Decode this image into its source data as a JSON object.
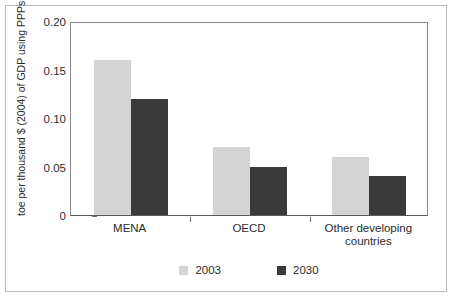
{
  "figure": {
    "clipped_top_text": "",
    "border_color": "#b9b9b9"
  },
  "chart_data": {
    "type": "bar",
    "title": "",
    "xlabel": "",
    "ylabel": "toe per thousand $ (2004) of GDP using PPPs",
    "categories": [
      "MENA",
      "OECD",
      "Other developing countries"
    ],
    "series": [
      {
        "name": "2003",
        "color": "#d4d4d4",
        "values": [
          0.16,
          0.07,
          0.06
        ]
      },
      {
        "name": "2030",
        "color": "#3a3a3a",
        "values": [
          0.12,
          0.05,
          0.04
        ]
      }
    ],
    "ylim": [
      0,
      0.2
    ],
    "yticks": [
      0,
      0.05,
      0.1,
      0.15,
      0.2
    ],
    "ytick_labels": [
      "0",
      "0.05",
      "0.10",
      "0.15",
      "0.20"
    ],
    "grid": false,
    "legend_position": "bottom"
  },
  "axis": {
    "ticks": [
      {
        "label": "0.20",
        "value": 0.2
      },
      {
        "label": "0.15",
        "value": 0.15
      },
      {
        "label": "0.10",
        "value": 0.1
      },
      {
        "label": "0.05",
        "value": 0.05
      },
      {
        "label": "0",
        "value": 0
      }
    ]
  },
  "categories": [
    {
      "label": "MENA"
    },
    {
      "label": "OECD"
    },
    {
      "label": "Other developing\ncountries",
      "line1": "Other developing",
      "line2": "countries"
    }
  ],
  "legend": {
    "items": [
      {
        "label": "2003",
        "color": "#d4d4d4"
      },
      {
        "label": "2030",
        "color": "#3a3a3a"
      }
    ]
  }
}
